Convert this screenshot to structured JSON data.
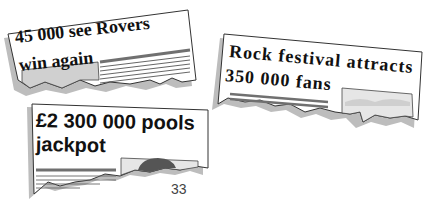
{
  "clippings": [
    {
      "id": "rovers",
      "headline_line1": "45 000 see Rovers",
      "headline_line2": "win again",
      "style": "serif-bold",
      "rotation_deg": -6
    },
    {
      "id": "rock-festival",
      "headline_line1": "Rock festival attracts",
      "headline_line2": "350 000 fans",
      "style": "serif-bold",
      "rotation_deg": 5
    },
    {
      "id": "pools-jackpot",
      "headline_line1": "£2 300 000 pools",
      "headline_line2": "jackpot",
      "style": "sans-bold",
      "rotation_deg": -1
    }
  ],
  "page": {
    "number": "33"
  },
  "colors": {
    "paper": "#ffffff",
    "outline": "#333333",
    "shadow": "#b8b8b8",
    "rule_dark": "#707070",
    "image_fill": "#d4d4d4",
    "sky_fill": "#e6e6e6",
    "hill_fill": "#555555"
  }
}
